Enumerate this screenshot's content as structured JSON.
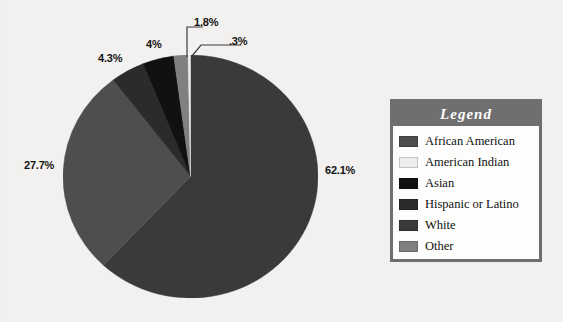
{
  "chart_data": {
    "type": "pie",
    "title": "",
    "categories": [
      "African American",
      "American Indian",
      "Asian",
      "Hispanic or Latino",
      "White",
      "Other"
    ],
    "values": [
      27.7,
      0.3,
      4.0,
      4.3,
      62.1,
      1.8
    ],
    "labels": [
      "27.7%",
      ".3%",
      "4%",
      "4.3%",
      "62.1%",
      "1.8%"
    ],
    "colors": [
      "#4e4e4e",
      "#eeeeec",
      "#111111",
      "#2b2b2b",
      "#3a3a3a",
      "#808080"
    ],
    "legend": {
      "position": "right",
      "title": "Legend",
      "entries": [
        {
          "label": "African American",
          "color": "#4e4e4e"
        },
        {
          "label": "American Indian",
          "color": "#eeeeec"
        },
        {
          "label": "Asian",
          "color": "#111111"
        },
        {
          "label": "Hispanic or Latino",
          "color": "#2b2b2b"
        },
        {
          "label": "White",
          "color": "#3a3a3a"
        },
        {
          "label": "Other",
          "color": "#808080"
        }
      ]
    },
    "grid": false,
    "background": "#f2f1ef"
  },
  "pie": {
    "label_white": "62.1%",
    "label_african_american": "27.7%",
    "label_hispanic": "4.3%",
    "label_asian": "4%",
    "label_other": "1.8%",
    "label_american_indian": ".3%"
  },
  "legend": {
    "title": "Legend",
    "items": [
      {
        "label": "African American"
      },
      {
        "label": "American Indian"
      },
      {
        "label": "Asian"
      },
      {
        "label": "Hispanic or Latino"
      },
      {
        "label": "White"
      },
      {
        "label": "Other"
      }
    ]
  }
}
